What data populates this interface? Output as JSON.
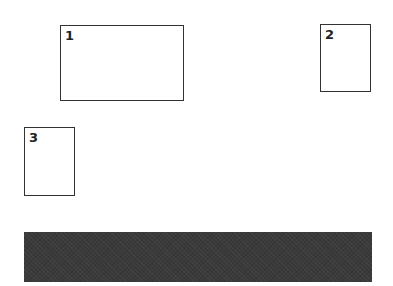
{
  "boxes": [
    {
      "label": "1"
    },
    {
      "label": "2"
    },
    {
      "label": "3"
    }
  ],
  "bar": {
    "color": "#3a3a3a"
  }
}
